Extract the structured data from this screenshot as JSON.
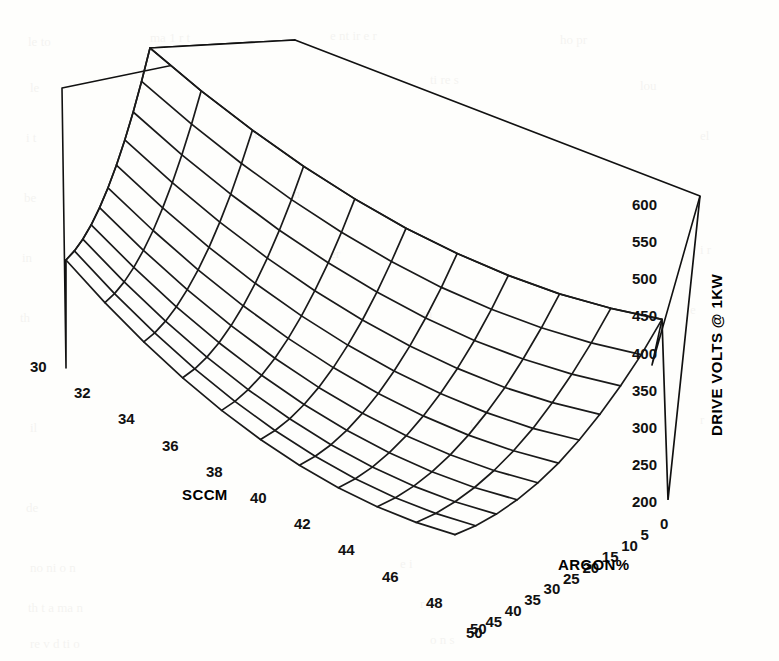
{
  "chart_data": {
    "type": "surface3d",
    "title": "",
    "xlabel": "ARGON%",
    "ylabel": "SCCM",
    "zlabel": "DRIVE VOLTS @ 1KW",
    "x_ticks": [
      0,
      5,
      10,
      15,
      20,
      25,
      30,
      35,
      40,
      45,
      50
    ],
    "y_ticks": [
      30,
      32,
      34,
      36,
      38,
      40,
      42,
      44,
      46,
      48,
      50
    ],
    "z_ticks": [
      200,
      250,
      300,
      350,
      400,
      450,
      500,
      550,
      600
    ],
    "xlim": [
      0,
      50
    ],
    "ylim": [
      30,
      50
    ],
    "zlim": [
      200,
      600
    ],
    "grid": false,
    "legend": null,
    "mesh_nx": 11,
    "mesh_ny": 11,
    "series": [
      {
        "name": "DRIVE VOLTS @ 1KW",
        "x": [
          0,
          5,
          10,
          15,
          20,
          25,
          30,
          35,
          40,
          45,
          50
        ],
        "y": [
          30,
          32,
          34,
          36,
          38,
          40,
          42,
          44,
          46,
          48,
          50
        ],
        "z": [
          [
            600,
            560,
            525,
            495,
            470,
            450,
            436,
            427,
            423,
            425,
            432
          ],
          [
            558,
            519,
            485,
            456,
            432,
            413,
            399,
            391,
            388,
            390,
            397
          ],
          [
            520,
            482,
            449,
            421,
            398,
            380,
            367,
            359,
            357,
            360,
            368
          ],
          [
            486,
            449,
            417,
            390,
            368,
            351,
            339,
            332,
            330,
            334,
            343
          ],
          [
            456,
            420,
            389,
            363,
            342,
            326,
            315,
            309,
            308,
            312,
            322
          ],
          [
            430,
            395,
            365,
            340,
            320,
            305,
            295,
            290,
            290,
            295,
            305
          ],
          [
            408,
            374,
            345,
            321,
            302,
            288,
            279,
            275,
            276,
            282,
            293
          ],
          [
            390,
            357,
            329,
            306,
            288,
            275,
            267,
            264,
            266,
            273,
            285
          ],
          [
            376,
            344,
            317,
            295,
            278,
            266,
            259,
            257,
            260,
            268,
            281
          ],
          [
            366,
            335,
            309,
            288,
            272,
            261,
            255,
            254,
            258,
            267,
            281
          ],
          [
            360,
            330,
            305,
            285,
            270,
            260,
            255,
            255,
            260,
            270,
            285
          ]
        ]
      }
    ]
  },
  "axes": {
    "z_title": "DRIVE VOLTS @ 1KW",
    "y_title": "SCCM",
    "x_title": "ARGON%",
    "z_labels": [
      "600",
      "550",
      "500",
      "450",
      "400",
      "350",
      "300",
      "250",
      "200"
    ],
    "y_labels": [
      "30",
      "32",
      "34",
      "36",
      "38",
      "40",
      "42",
      "44",
      "46",
      "48",
      "50"
    ],
    "x_labels": [
      "0",
      "5",
      "10",
      "15",
      "20",
      "25",
      "30",
      "35",
      "40",
      "45",
      "50"
    ]
  },
  "colors": {
    "ink": "#111111",
    "paper": "#fefefc",
    "mesh": "#1a1a1a"
  },
  "background_text": [
    "the presence of a",
    "in the plasma",
    "was observed to",
    "reduce the drive",
    "voltage required",
    "at constant power",
    "for the range of",
    "flow conditions",
    "shown in the figure",
    "above, which sum",
    "marizes the data",
    "collected during",
    "this series of runs"
  ]
}
